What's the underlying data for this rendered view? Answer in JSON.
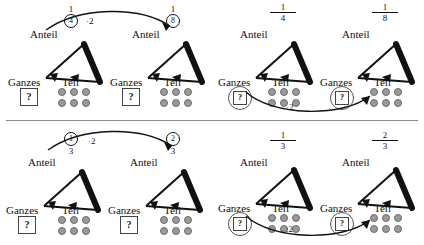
{
  "page": {
    "divider_color": "#8d8d8d",
    "dot_color": "#9a9a9a"
  },
  "labels": {
    "anteil": "Anteil",
    "ganzes": "Ganzes",
    "teil": "Teil",
    "question": "?"
  },
  "panels": [
    {
      "id": "top-left",
      "operator": "·2",
      "operator_position": "top",
      "units": [
        {
          "fraction": {
            "numerator": "1",
            "denominator": "4",
            "circled": "denominator",
            "bar": false
          },
          "whole": {
            "value": "?",
            "circled": false
          },
          "part_dots": 6
        },
        {
          "fraction": {
            "numerator": "1",
            "denominator": "8",
            "circled": "denominator",
            "bar": false
          },
          "whole": {
            "value": "?",
            "circled": false
          },
          "part_dots": 6
        }
      ]
    },
    {
      "id": "top-right",
      "operator": "·2",
      "operator_position": "bottom",
      "units": [
        {
          "fraction": {
            "numerator": "1",
            "denominator": "4",
            "circled": "none",
            "bar": true
          },
          "whole": {
            "value": "?",
            "circled": true
          },
          "part_dots": 6
        },
        {
          "fraction": {
            "numerator": "1",
            "denominator": "8",
            "circled": "none",
            "bar": true
          },
          "whole": {
            "value": "?",
            "circled": true
          },
          "part_dots": 6
        }
      ]
    },
    {
      "id": "bottom-left",
      "operator": "·2",
      "operator_position": "top",
      "units": [
        {
          "fraction": {
            "numerator": "1",
            "denominator": "3",
            "circled": "numerator",
            "bar": false
          },
          "whole": {
            "value": "?",
            "circled": false
          },
          "part_dots": 6
        },
        {
          "fraction": {
            "numerator": "2",
            "denominator": "3",
            "circled": "numerator",
            "bar": false
          },
          "whole": {
            "value": "?",
            "circled": false
          },
          "part_dots": 6
        }
      ]
    },
    {
      "id": "bottom-right",
      "operator": ":2",
      "operator_position": "bottom",
      "units": [
        {
          "fraction": {
            "numerator": "1",
            "denominator": "3",
            "circled": "none",
            "bar": true
          },
          "whole": {
            "value": "?",
            "circled": true
          },
          "part_dots": 6
        },
        {
          "fraction": {
            "numerator": "2",
            "denominator": "3",
            "circled": "none",
            "bar": true
          },
          "whole": {
            "value": "?",
            "circled": true
          },
          "part_dots": 6
        }
      ]
    }
  ]
}
